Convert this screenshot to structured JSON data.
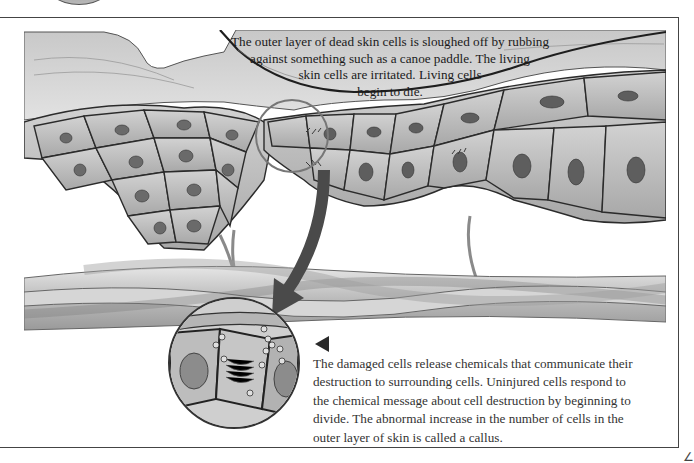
{
  "figure": {
    "top_caption": {
      "lines": [
        "The outer layer of dead skin cells is sloughed off by rubbing",
        "against something such as a canoe paddle. The living",
        "skin cells are irritated. Living cells",
        "begin to die."
      ]
    },
    "bottom_caption": {
      "pointer": "left-triangle",
      "lines": [
        "The damaged cells release chemicals that communicate their",
        "destruction to surrounding cells. Uninjured cells respond to",
        "the chemical message about cell destruction by beginning to",
        "divide. The abnormal increase in the number of cells in the",
        "outer layer of skin is called a callus."
      ]
    },
    "elements": {
      "outer_dead_layer": "outer-dead-skin-layer",
      "living_cells": "epidermal-cell-layer",
      "blood_vessels": "blood-vessel-bundle",
      "nerve_fibers": "nerve-fibers",
      "arrow": "magnify-arrow",
      "magnifier": "magnified-cell-view"
    },
    "colors": {
      "frame": "#444444",
      "cell_fill": "#bdbdbd",
      "cell_outline": "#2b2b2b",
      "nucleus": "#6a6a6a",
      "arrow": "#4a4a4a",
      "text": "#1a1a1a"
    }
  },
  "page": {
    "corner_mark": "∠"
  }
}
